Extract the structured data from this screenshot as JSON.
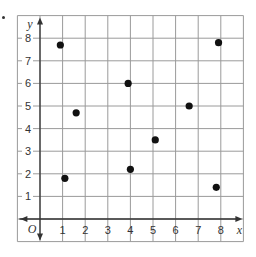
{
  "chart_data": {
    "type": "scatter",
    "title": "",
    "xlabel": "x",
    "ylabel": "y",
    "origin_label": "O",
    "xlim": [
      -1,
      9
    ],
    "ylim": [
      -1,
      9
    ],
    "grid": true,
    "legend": null,
    "x_ticks": [
      "1",
      "2",
      "3",
      "4",
      "5",
      "6",
      "7",
      "8"
    ],
    "y_ticks": [
      "1",
      "2",
      "3",
      "4",
      "5",
      "6",
      "7",
      "8"
    ],
    "points": [
      {
        "x": 0.9,
        "y": 7.7
      },
      {
        "x": 1.6,
        "y": 4.7
      },
      {
        "x": 1.1,
        "y": 1.8
      },
      {
        "x": 3.9,
        "y": 6.0
      },
      {
        "x": 4.0,
        "y": 2.2
      },
      {
        "x": 5.1,
        "y": 3.5
      },
      {
        "x": 6.6,
        "y": 5.0
      },
      {
        "x": 7.8,
        "y": 1.4
      },
      {
        "x": 7.9,
        "y": 7.8
      }
    ],
    "colors": {
      "grid": "#9a9a9a",
      "axis": "#333333",
      "point": "#111111"
    }
  }
}
